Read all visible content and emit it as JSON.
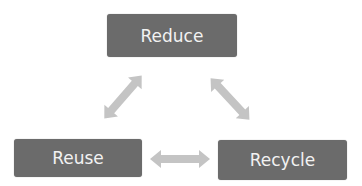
{
  "diagram": {
    "nodes": [
      {
        "id": "reduce",
        "label": "Reduce"
      },
      {
        "id": "reuse",
        "label": "Reuse"
      },
      {
        "id": "recycle",
        "label": "Recycle"
      }
    ],
    "edges": [
      {
        "from": "reduce",
        "to": "reuse",
        "type": "bidirectional"
      },
      {
        "from": "reduce",
        "to": "recycle",
        "type": "bidirectional"
      },
      {
        "from": "reuse",
        "to": "recycle",
        "type": "bidirectional"
      }
    ],
    "colors": {
      "node_fill": "#6b6b6b",
      "node_text": "#f2f2f2",
      "arrow": "#c4c4c4"
    }
  }
}
